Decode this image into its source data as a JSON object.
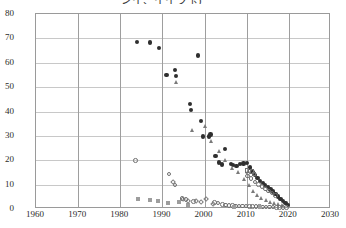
{
  "chart_data": {
    "type": "scatter",
    "title": "シイ、イイラ玉)",
    "xlabel": "",
    "ylabel": "",
    "xlim": [
      1960,
      2030
    ],
    "ylim": [
      0,
      80
    ],
    "xticks": [
      1960,
      1970,
      1980,
      1990,
      2000,
      2010,
      2020,
      2030
    ],
    "yticks": [
      0,
      10,
      20,
      30,
      40,
      50,
      60,
      70,
      80
    ],
    "grid": true,
    "legend": "none",
    "series": [
      {
        "name": "filled-circle",
        "marker": "filled-circle",
        "color": "#2f2f2f",
        "points": [
          [
            1984.0,
            68.5
          ],
          [
            1987.0,
            68.3
          ],
          [
            1989.2,
            66.0
          ],
          [
            1991.0,
            55.0
          ],
          [
            1993.0,
            57.0
          ],
          [
            1993.2,
            54.5
          ],
          [
            1996.5,
            43.0
          ],
          [
            1996.8,
            40.5
          ],
          [
            1998.5,
            63.0
          ],
          [
            1999.2,
            36.0
          ],
          [
            1999.6,
            29.8
          ],
          [
            2001.0,
            29.8
          ],
          [
            2001.4,
            30.5
          ],
          [
            2002.6,
            21.8
          ],
          [
            2003.4,
            19.0
          ],
          [
            2004.2,
            18.2
          ],
          [
            2004.8,
            24.5
          ],
          [
            2006.2,
            18.5
          ],
          [
            2006.8,
            18.0
          ],
          [
            2007.6,
            17.6
          ],
          [
            2008.4,
            18.4
          ],
          [
            2009.2,
            18.6
          ],
          [
            2010.0,
            18.8
          ],
          [
            2010.8,
            17.0
          ],
          [
            2011.4,
            15.2
          ],
          [
            2012.0,
            14.0
          ],
          [
            2012.6,
            12.6
          ],
          [
            2013.2,
            11.4
          ],
          [
            2013.8,
            10.6
          ],
          [
            2014.4,
            9.8
          ],
          [
            2015.0,
            9.0
          ],
          [
            2015.6,
            8.0
          ],
          [
            2016.2,
            7.2
          ],
          [
            2016.8,
            6.2
          ],
          [
            2017.4,
            5.2
          ],
          [
            2018.0,
            4.2
          ],
          [
            2018.6,
            3.2
          ],
          [
            2019.2,
            2.4
          ],
          [
            2019.8,
            1.6
          ]
        ]
      },
      {
        "name": "triangle",
        "marker": "triangle",
        "color": "#7a7a7a",
        "points": [
          [
            1993.4,
            51.8
          ],
          [
            1997.2,
            32.0
          ],
          [
            2000.2,
            34.0
          ],
          [
            2001.6,
            27.8
          ],
          [
            2003.6,
            23.6
          ],
          [
            2005.0,
            20.0
          ],
          [
            2006.6,
            16.4
          ],
          [
            2008.0,
            15.0
          ],
          [
            2009.4,
            12.2
          ],
          [
            2010.6,
            9.4
          ],
          [
            2011.6,
            7.0
          ],
          [
            2012.6,
            5.4
          ],
          [
            2013.6,
            4.2
          ],
          [
            2014.6,
            3.4
          ],
          [
            2015.6,
            2.8
          ],
          [
            2016.6,
            2.2
          ],
          [
            2017.6,
            1.8
          ],
          [
            2018.6,
            1.4
          ]
        ]
      },
      {
        "name": "open-circle",
        "marker": "open-circle",
        "color": "#6f6f6f",
        "points": [
          [
            1983.6,
            19.8
          ],
          [
            1991.6,
            14.4
          ],
          [
            1993.0,
            9.8
          ],
          [
            1994.6,
            4.2
          ],
          [
            1995.6,
            3.8
          ],
          [
            1997.4,
            3.0
          ],
          [
            2002.4,
            2.6
          ],
          [
            2003.2,
            2.4
          ],
          [
            2004.2,
            1.8
          ],
          [
            2005.0,
            1.6
          ],
          [
            2005.8,
            1.5
          ],
          [
            2006.6,
            1.4
          ],
          [
            2007.4,
            1.3
          ],
          [
            2008.2,
            1.3
          ],
          [
            2009.0,
            1.2
          ],
          [
            2009.8,
            1.2
          ],
          [
            2010.6,
            1.1
          ],
          [
            2011.4,
            1.1
          ],
          [
            2012.2,
            1.0
          ],
          [
            2013.0,
            1.0
          ],
          [
            2013.8,
            0.9
          ],
          [
            2014.6,
            0.9
          ],
          [
            2015.4,
            0.8
          ],
          [
            2016.2,
            0.8
          ],
          [
            2017.0,
            0.7
          ],
          [
            2017.8,
            0.7
          ],
          [
            2018.6,
            0.6
          ],
          [
            2019.4,
            0.6
          ],
          [
            2011.0,
            12.4
          ],
          [
            2012.0,
            11.0
          ],
          [
            2012.8,
            10.0
          ],
          [
            2013.6,
            9.2
          ],
          [
            2014.4,
            8.2
          ],
          [
            2015.2,
            7.4
          ],
          [
            2016.0,
            6.6
          ],
          [
            2016.8,
            5.6
          ],
          [
            2010.2,
            13.6
          ]
        ]
      },
      {
        "name": "gray-square",
        "marker": "filled-square",
        "color": "#9d9d9d",
        "points": [
          [
            1984.2,
            4.2
          ],
          [
            1987.0,
            3.6
          ],
          [
            1989.0,
            3.4
          ],
          [
            1991.4,
            2.6
          ],
          [
            1994.0,
            3.0
          ],
          [
            1996.0,
            1.6
          ],
          [
            2007.0,
            0.8
          ],
          [
            2013.2,
            0.9
          ]
        ]
      },
      {
        "name": "open-diamond",
        "marker": "open-diamond",
        "color": "#7b7b7b",
        "points": [
          [
            1992.6,
            11.0
          ],
          [
            1994.8,
            4.0
          ],
          [
            1996.0,
            3.4
          ],
          [
            1998.0,
            3.2
          ],
          [
            1999.2,
            3.0
          ],
          [
            2000.4,
            4.2
          ],
          [
            2002.0,
            2.0
          ],
          [
            2010.4,
            14.8
          ]
        ]
      },
      {
        "name": "open-square",
        "marker": "open-square",
        "color": "#6f6f6f",
        "points": [
          [
            2010.0,
            15.8
          ],
          [
            2011.2,
            15.4
          ],
          [
            2011.8,
            14.4
          ]
        ]
      }
    ]
  }
}
